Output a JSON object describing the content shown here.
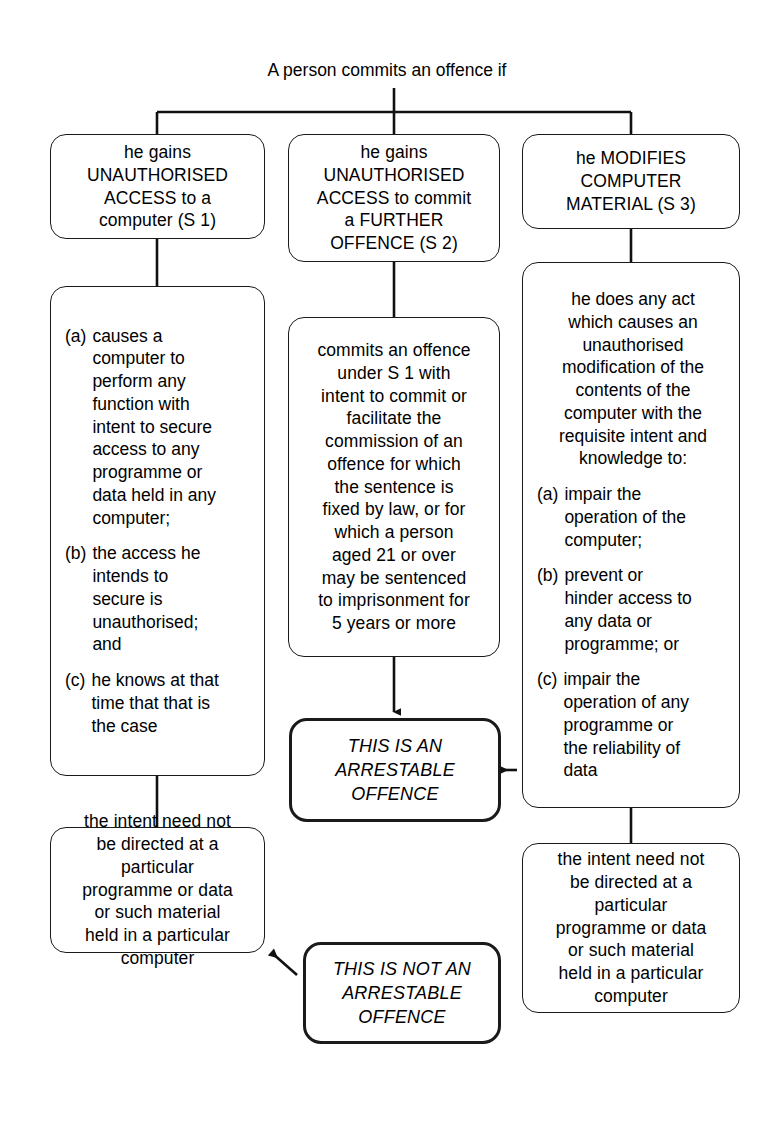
{
  "diagram": {
    "title": "A person commits an offence if",
    "accent_line_color": "#1a1a1a",
    "background_color": "#ffffff"
  },
  "nodes": {
    "s1_head": "he gains\nUNAUTHORISED\nACCESS to a\ncomputer (S 1)",
    "s2_head": "he gains\nUNAUTHORISED\nACCESS to commit\na FURTHER\nOFFENCE (S 2)",
    "s3_head": "he MODIFIES\nCOMPUTER\nMATERIAL (S 3)",
    "s1_detail": {
      "items": [
        {
          "mark": "(a)",
          "body": "causes a\ncomputer to\nperform any\nfunction with\nintent to secure\naccess to any\nprogramme or\ndata held in any\ncomputer;"
        },
        {
          "mark": "(b)",
          "body": "the access he\nintends to\nsecure is\nunauthorised;\nand"
        },
        {
          "mark": "(c)",
          "body": "he knows at that\ntime that that is\nthe case"
        }
      ]
    },
    "s2_detail": "commits an offence\nunder S 1 with\nintent to commit or\nfacilitate the\ncommission of an\noffence for which\nthe sentence is\nfixed by law, or for\nwhich a person\naged 21 or over\nmay be sentenced\nto imprisonment for\n5 years or more",
    "s3_detail": {
      "intro": "he does any act\nwhich causes an\nunauthorised\nmodification of the\ncontents of the\ncomputer with the\nrequisite intent and\nknowledge to:",
      "items": [
        {
          "mark": "(a)",
          "body": "impair the\noperation of the\ncomputer;"
        },
        {
          "mark": "(b)",
          "body": "prevent or\nhinder access to\nany data or\nprogramme; or"
        },
        {
          "mark": "(c)",
          "body": "impair the\noperation of any\nprogramme or\nthe reliability of\ndata"
        }
      ]
    },
    "s1_intent_note": "the intent need not\nbe directed at a\nparticular\nprogramme or data\nor such material\nheld in a particular\ncomputer",
    "s3_intent_note": "the intent need not\nbe directed at a\nparticular\nprogramme or data\nor such material\nheld in a particular\ncomputer",
    "arrestable": "THIS IS AN\nARRESTABLE\nOFFENCE",
    "not_arrestable": "THIS IS NOT AN\nARRESTABLE\nOFFENCE"
  }
}
